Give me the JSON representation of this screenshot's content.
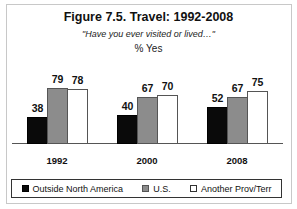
{
  "chart_data": {
    "type": "bar",
    "title": "Figure 7.5. Travel: 1992-2008",
    "subtitle": "\"Have you ever visited or lived…\"",
    "xlabel": "",
    "ylabel": "% Yes",
    "categories": [
      "1992",
      "2000",
      "2008"
    ],
    "series": [
      {
        "name": "Outside North America",
        "color": "#0a0a0a",
        "values": [
          38,
          40,
          52
        ]
      },
      {
        "name": "U.S.",
        "color": "#8c8c8c",
        "values": [
          79,
          67,
          67
        ]
      },
      {
        "name": "Another Prov/Terr",
        "color": "#ffffff",
        "values": [
          78,
          70,
          75
        ]
      }
    ],
    "ylim": [
      0,
      100
    ],
    "grid": false,
    "legend_position": "bottom",
    "data_labels": true
  }
}
